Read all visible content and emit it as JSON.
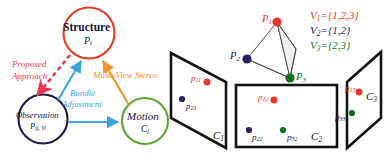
{
  "figure": {
    "caption_present": false,
    "panels": [
      "sfm-pipeline-graph",
      "multi-view-visibility"
    ]
  },
  "colors": {
    "structure_red": "#e03c1e",
    "observation_navy": "#1b1b4d",
    "motion_green": "#5aa832",
    "bundle_blue": "#3aa6dd",
    "mvs_orange": "#f0932b",
    "proposed_red": "#e8384f",
    "point_red": "#e8372b",
    "point_navy": "#262261",
    "point_green": "#13701f",
    "plane_black": "#141414",
    "tetra_fill": "#efefef"
  },
  "left_panel": {
    "nodes": [
      {
        "id": "structure",
        "title": "Structure",
        "sub": "P",
        "sub_index": "i",
        "color_key": "structure_red"
      },
      {
        "id": "observation",
        "title": "Observation",
        "sub": "P",
        "sub_index": "ij, Vi",
        "color_key": "observation_navy"
      },
      {
        "id": "motion",
        "title": "Motion",
        "sub": "C",
        "sub_index": "j",
        "color_key": "motion_green"
      }
    ],
    "edges": [
      {
        "id": "proposed-approach",
        "label": "Proposed\nApproach",
        "from": "structure",
        "to": "observation",
        "style": "dashed",
        "color_key": "proposed_red"
      },
      {
        "id": "bundle-adjustment",
        "label": "Bundle\nAdjustment",
        "from": "observation",
        "to": "structure",
        "style": "solid",
        "color_key": "bundle_blue"
      },
      {
        "id": "observation-motion",
        "label": "",
        "from": "observation",
        "to": "motion",
        "style": "solid",
        "color_key": "bundle_blue"
      },
      {
        "id": "multi-view-stereo",
        "label": "Multi-View Stereo",
        "from": "motion",
        "to": "structure",
        "style": "solid",
        "color_key": "mvs_orange"
      }
    ],
    "edge_labels": {
      "proposed_line1": "Proposed",
      "proposed_line2": "Approach",
      "bundle_line1": "Bundle",
      "bundle_line2": "Adjustment",
      "mvs": "Multi-View Stereo"
    }
  },
  "right_panel": {
    "visibility_sets": [
      {
        "name": "V",
        "index": "1",
        "value": "={1,2,3}",
        "color_key": "point_red"
      },
      {
        "name": "V",
        "index": "2",
        "value": "={1,2}",
        "color_key": "point_navy"
      },
      {
        "name": "V",
        "index": "3",
        "value": "={2,3}",
        "color_key": "point_green"
      }
    ],
    "world_points": [
      {
        "name": "P",
        "index": "1",
        "color_key": "point_red",
        "label_side": "left"
      },
      {
        "name": "P",
        "index": "2",
        "color_key": "point_navy",
        "label_side": "left"
      },
      {
        "name": "P",
        "index": "3",
        "color_key": "point_green",
        "label_side": "right"
      }
    ],
    "cameras": [
      {
        "id": "C1",
        "name": "C",
        "index": "1",
        "projections": [
          {
            "name": "p",
            "index": "11",
            "color_key": "point_red"
          },
          {
            "name": "p",
            "index": "21",
            "color_key": "point_navy"
          }
        ]
      },
      {
        "id": "C2",
        "name": "C",
        "index": "2",
        "projections": [
          {
            "name": "p",
            "index": "12",
            "color_key": "point_red"
          },
          {
            "name": "p",
            "index": "22",
            "color_key": "point_navy"
          },
          {
            "name": "p",
            "index": "32",
            "color_key": "point_green"
          }
        ]
      },
      {
        "id": "C3",
        "name": "C",
        "index": "3",
        "projections": [
          {
            "name": "p",
            "index": "13",
            "color_key": "point_red"
          },
          {
            "name": "p",
            "index": "33",
            "color_key": "point_green"
          }
        ]
      }
    ]
  }
}
